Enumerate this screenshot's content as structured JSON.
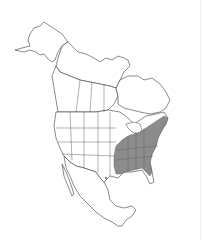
{
  "map": {
    "title": "Range map - North America",
    "region": "North America",
    "range_fill": "#8c8c8c",
    "outline_color": "#3a3a3a",
    "land_fill": "#ffffff",
    "background": "#ffffff",
    "range_description": "Eastern United States shaded"
  }
}
